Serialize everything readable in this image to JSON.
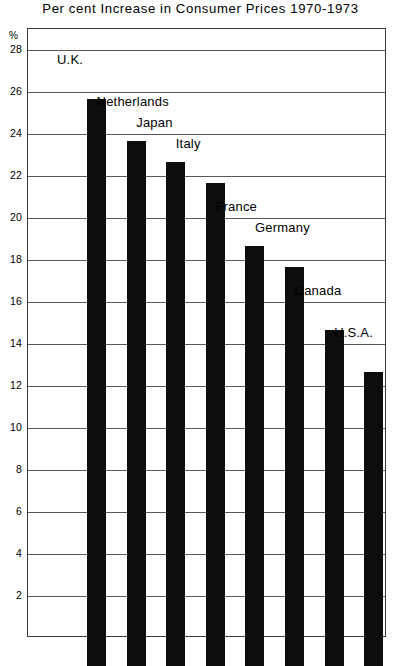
{
  "chart_data": {
    "type": "bar",
    "title": "Per cent Increase in Consumer Prices 1970-1973",
    "xlabel": "",
    "ylabel": "%",
    "ylim": [
      0,
      29
    ],
    "grid": true,
    "legend": "none",
    "yticks": [
      28,
      26,
      24,
      22,
      20,
      18,
      16,
      14,
      12,
      10,
      8,
      6,
      4,
      2
    ],
    "ytick_labels": [
      "28",
      "26",
      "24",
      "22",
      "20",
      "18",
      "16",
      "14",
      "12",
      "10",
      "8",
      "6",
      "4",
      "2"
    ],
    "categories": [
      "U.K.",
      "Netherlands",
      "Japan",
      "Italy",
      "France",
      "Germany",
      "Canada",
      "U.S.A."
    ],
    "values": [
      27,
      25,
      24,
      23,
      20,
      19,
      16,
      14
    ],
    "bar_color": "#0d0d0d",
    "frame_color": "#3b3b3b",
    "grid_color": "#5a5a5a",
    "annotations": [
      {
        "label": "U.K.",
        "value": 27
      },
      {
        "label": "Netherlands",
        "value": 25
      },
      {
        "label": "Japan",
        "value": 24
      },
      {
        "label": "Italy",
        "value": 23
      },
      {
        "label": "France",
        "value": 20
      },
      {
        "label": "Germany",
        "value": 19
      },
      {
        "label": "Canada",
        "value": 16
      },
      {
        "label": "U.S.A.",
        "value": 14
      }
    ]
  }
}
